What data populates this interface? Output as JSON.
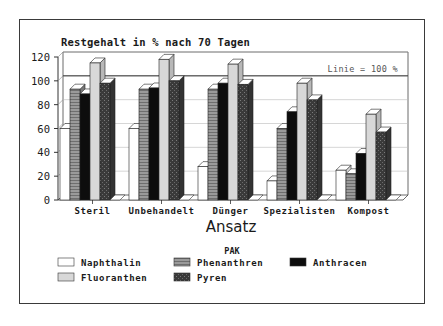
{
  "chart_data": {
    "type": "bar",
    "style": "3d-grouped",
    "title": "Restgehalt in % nach 70 Tagen",
    "xlabel": "Ansatz",
    "ylabel": "",
    "ylim": [
      0,
      120
    ],
    "yticks": [
      0,
      20,
      40,
      60,
      80,
      100,
      120
    ],
    "grid": true,
    "reference_line": {
      "value": 100,
      "label": "Linie = 100 %"
    },
    "categories": [
      "Steril",
      "Unbehandelt",
      "Dünger",
      "Spezialisten",
      "Kompost"
    ],
    "legend_title": "PAK",
    "legend_position": "bottom",
    "series": [
      {
        "name": "Naphthalin",
        "fill": "#ffffff",
        "pattern": "plain",
        "values": [
          60,
          60,
          28,
          16,
          25
        ]
      },
      {
        "name": "Phenanthren",
        "fill": "#8c8c8c",
        "pattern": "hstripes",
        "values": [
          93,
          93,
          93,
          60,
          22
        ]
      },
      {
        "name": "Anthracen",
        "fill": "#0d0d0d",
        "pattern": "plain",
        "values": [
          89,
          94,
          98,
          74,
          39
        ]
      },
      {
        "name": "Fluoranthen",
        "fill": "#d8d8d8",
        "pattern": "plain",
        "values": [
          115,
          118,
          114,
          98,
          72
        ]
      },
      {
        "name": "Pyren",
        "fill": "#3c3c3c",
        "pattern": "speckle",
        "values": [
          98,
          100,
          97,
          84,
          57
        ]
      }
    ]
  }
}
